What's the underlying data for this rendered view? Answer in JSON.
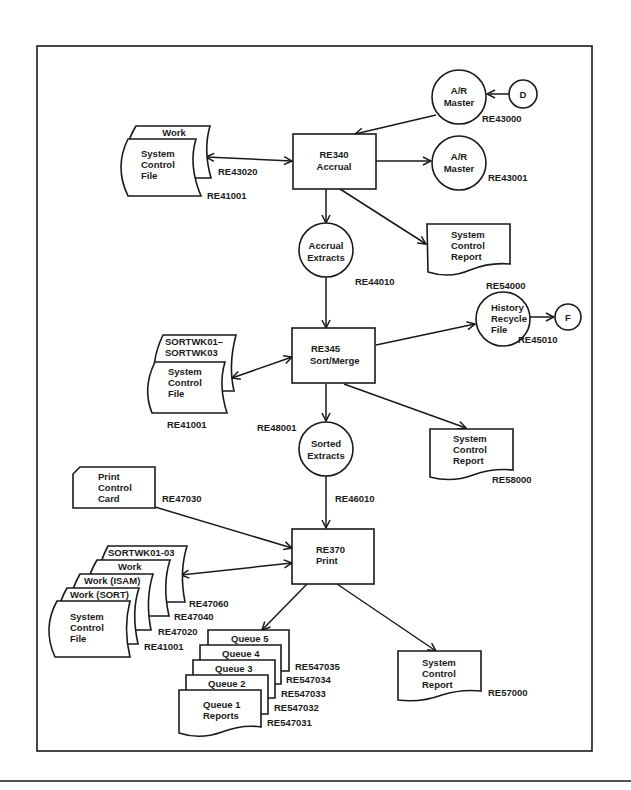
{
  "diagram": {
    "type": "system flowchart",
    "processes": [
      {
        "id": "re340",
        "line1": "RE340",
        "line2": "Accrual"
      },
      {
        "id": "re345",
        "line1": "RE345",
        "line2": "Sort/Merge"
      },
      {
        "id": "re370",
        "line1": "RE370",
        "line2": "Print"
      }
    ],
    "files": {
      "ar_master_in": {
        "line1": "A/R",
        "line2": "Master",
        "code": "RE43000"
      },
      "connector_d": {
        "label": "D"
      },
      "ar_master_out": {
        "line1": "A/R",
        "line2": "Master",
        "code": "RE43001"
      },
      "work_file_1": {
        "label": "Work",
        "code": "RE43020"
      },
      "scf_1": {
        "line1": "System",
        "line2": "Control",
        "line3": "File",
        "code": "RE41001"
      },
      "accrual_extracts": {
        "line1": "Accrual",
        "line2": "Extracts",
        "code": "RE44010"
      },
      "scr_1": {
        "line1": "System",
        "line2": "Control",
        "line3": "Report",
        "code": "RE54000"
      },
      "history_recycle": {
        "line1": "History",
        "line2": "Recycle",
        "line3": "File",
        "code": "RE45010"
      },
      "connector_f": {
        "label": "F"
      },
      "sortwk_1": {
        "line1": "SORTWK01–",
        "line2": "SORTWK03",
        "code": "RE48001"
      },
      "scf_2": {
        "line1": "System",
        "line2": "Control",
        "line3": "File",
        "code": "RE41001"
      },
      "sorted_extracts": {
        "line1": "Sorted",
        "line2": "Extracts",
        "code": "RE46010"
      },
      "scr_2": {
        "line1": "System",
        "line2": "Control",
        "line3": "Report",
        "code": "RE58000"
      },
      "print_card": {
        "line1": "Print",
        "line2": "Control",
        "line3": "Card",
        "code": "RE47030"
      },
      "sortwk_2": {
        "label": "SORTWK01-03",
        "code": "RE47060"
      },
      "work_2": {
        "label": "Work",
        "code": "RE47040"
      },
      "work_isam": {
        "label": "Work (ISAM)",
        "code": "RE47020"
      },
      "work_sort": {
        "label": "Work (SORT)"
      },
      "scf_3": {
        "line1": "System",
        "line2": "Control",
        "line3": "File",
        "code": "RE41001"
      },
      "queue5": {
        "label": "Queue 5",
        "code": "RE547035"
      },
      "queue4": {
        "label": "Queue 4",
        "code": "RE547034"
      },
      "queue3": {
        "label": "Queue 3",
        "code": "RE547033"
      },
      "queue2": {
        "label": "Queue 2",
        "code": "RE547032"
      },
      "queue1": {
        "line1": "Queue 1",
        "line2": "Reports",
        "code": "RE547031"
      },
      "scr_3": {
        "line1": "System",
        "line2": "Control",
        "line3": "Report",
        "mark": "ₜ",
        "code": "RE57000"
      }
    }
  }
}
